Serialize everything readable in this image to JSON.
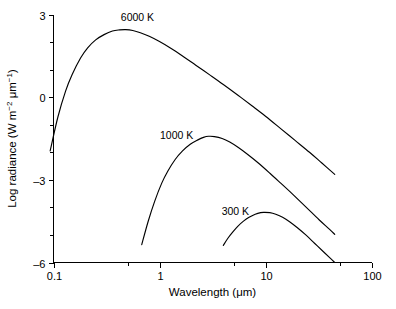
{
  "chart_data": {
    "type": "line",
    "title": "",
    "xlabel": "Wavelength (μm)",
    "ylabel": "Log radiance (W m⁻² μm⁻¹)",
    "xlabel_parts": {
      "text": "Wavelength (μm)"
    },
    "ylabel_parts": {
      "lead": "Log radiance (W m",
      "sup1": "-2",
      "mid": " μm",
      "sup2": "-1",
      "tail": ")"
    },
    "x_scale": "log",
    "y_scale": "linear",
    "xlim": [
      0.1,
      100
    ],
    "ylim": [
      -6,
      3
    ],
    "grid": false,
    "legend": "none",
    "x_ticks": [
      {
        "value": 0.1,
        "label": "0.1",
        "major": true
      },
      {
        "value": 0.5,
        "label": "",
        "major": false
      },
      {
        "value": 1,
        "label": "1",
        "major": true
      },
      {
        "value": 5,
        "label": "",
        "major": false
      },
      {
        "value": 10,
        "label": "10",
        "major": true
      },
      {
        "value": 50,
        "label": "",
        "major": false
      },
      {
        "value": 100,
        "label": "100",
        "major": true
      }
    ],
    "y_ticks": [
      {
        "value": 3,
        "label": "3",
        "major": true
      },
      {
        "value": 2,
        "label": "",
        "major": false
      },
      {
        "value": 1,
        "label": "",
        "major": false
      },
      {
        "value": 0,
        "label": "0",
        "major": true
      },
      {
        "value": -1,
        "label": "",
        "major": false
      },
      {
        "value": -2,
        "label": "",
        "major": false
      },
      {
        "value": -3,
        "label": "-3",
        "major": true
      },
      {
        "value": -4,
        "label": "",
        "major": false
      },
      {
        "value": -5,
        "label": "",
        "major": false
      },
      {
        "value": -6,
        "label": "-6",
        "major": true
      }
    ],
    "series": [
      {
        "name": "6000 K",
        "temperature_K": 6000,
        "label": "6000 K",
        "label_pos": {
          "x": 0.62,
          "y": 2.75
        },
        "peak": {
          "x": 0.48,
          "y": 2.45
        },
        "x_start": 0.093,
        "x_end": 45,
        "points": [
          {
            "x": 0.093,
            "y": -1.95
          },
          {
            "x": 0.11,
            "y": -0.72
          },
          {
            "x": 0.13,
            "y": 0.22
          },
          {
            "x": 0.15,
            "y": 0.82
          },
          {
            "x": 0.18,
            "y": 1.42
          },
          {
            "x": 0.21,
            "y": 1.79
          },
          {
            "x": 0.25,
            "y": 2.08
          },
          {
            "x": 0.3,
            "y": 2.27
          },
          {
            "x": 0.36,
            "y": 2.4
          },
          {
            "x": 0.42,
            "y": 2.44
          },
          {
            "x": 0.48,
            "y": 2.45
          },
          {
            "x": 0.56,
            "y": 2.42
          },
          {
            "x": 0.66,
            "y": 2.34
          },
          {
            "x": 0.8,
            "y": 2.21
          },
          {
            "x": 1.0,
            "y": 2.02
          },
          {
            "x": 1.3,
            "y": 1.76
          },
          {
            "x": 1.7,
            "y": 1.46
          },
          {
            "x": 2.2,
            "y": 1.16
          },
          {
            "x": 3.0,
            "y": 0.8
          },
          {
            "x": 4.0,
            "y": 0.46
          },
          {
            "x": 5.5,
            "y": 0.07
          },
          {
            "x": 7.5,
            "y": -0.32
          },
          {
            "x": 10,
            "y": -0.69
          },
          {
            "x": 14,
            "y": -1.15
          },
          {
            "x": 19,
            "y": -1.57
          },
          {
            "x": 26,
            "y": -2.0
          },
          {
            "x": 34,
            "y": -2.39
          },
          {
            "x": 45,
            "y": -2.8
          }
        ]
      },
      {
        "name": "1000 K",
        "temperature_K": 1000,
        "label": "1000 K",
        "label_pos": {
          "x": 1.45,
          "y": -1.52
        },
        "peak": {
          "x": 2.9,
          "y": -1.42
        },
        "x_start": 0.68,
        "x_end": 45,
        "points": [
          {
            "x": 0.68,
            "y": -5.35
          },
          {
            "x": 0.78,
            "y": -4.52
          },
          {
            "x": 0.9,
            "y": -3.78
          },
          {
            "x": 1.05,
            "y": -3.12
          },
          {
            "x": 1.2,
            "y": -2.68
          },
          {
            "x": 1.4,
            "y": -2.27
          },
          {
            "x": 1.65,
            "y": -1.95
          },
          {
            "x": 1.95,
            "y": -1.71
          },
          {
            "x": 2.3,
            "y": -1.55
          },
          {
            "x": 2.6,
            "y": -1.46
          },
          {
            "x": 2.9,
            "y": -1.42
          },
          {
            "x": 3.3,
            "y": -1.43
          },
          {
            "x": 3.9,
            "y": -1.5
          },
          {
            "x": 4.6,
            "y": -1.63
          },
          {
            "x": 5.5,
            "y": -1.82
          },
          {
            "x": 6.8,
            "y": -2.08
          },
          {
            "x": 8.5,
            "y": -2.38
          },
          {
            "x": 11,
            "y": -2.76
          },
          {
            "x": 14,
            "y": -3.13
          },
          {
            "x": 18,
            "y": -3.52
          },
          {
            "x": 24,
            "y": -3.98
          },
          {
            "x": 32,
            "y": -4.45
          },
          {
            "x": 40,
            "y": -4.79
          },
          {
            "x": 45,
            "y": -4.98
          }
        ]
      },
      {
        "name": "300 K",
        "temperature_K": 300,
        "label": "300 K",
        "label_pos": {
          "x": 5.2,
          "y": -4.28
        },
        "peak": {
          "x": 9.7,
          "y": -4.18
        },
        "x_start": 4.0,
        "x_end": 45,
        "points": [
          {
            "x": 4.0,
            "y": -5.38
          },
          {
            "x": 4.4,
            "y": -5.13
          },
          {
            "x": 4.9,
            "y": -4.9
          },
          {
            "x": 5.5,
            "y": -4.68
          },
          {
            "x": 6.2,
            "y": -4.5
          },
          {
            "x": 7.0,
            "y": -4.36
          },
          {
            "x": 8.0,
            "y": -4.25
          },
          {
            "x": 9.0,
            "y": -4.19
          },
          {
            "x": 9.7,
            "y": -4.18
          },
          {
            "x": 11,
            "y": -4.19
          },
          {
            "x": 12.5,
            "y": -4.25
          },
          {
            "x": 14.5,
            "y": -4.36
          },
          {
            "x": 17,
            "y": -4.53
          },
          {
            "x": 20,
            "y": -4.74
          },
          {
            "x": 24,
            "y": -5.0
          },
          {
            "x": 29,
            "y": -5.3
          },
          {
            "x": 35,
            "y": -5.6
          },
          {
            "x": 41,
            "y": -5.85
          },
          {
            "x": 45,
            "y": -6.0
          }
        ]
      }
    ]
  }
}
